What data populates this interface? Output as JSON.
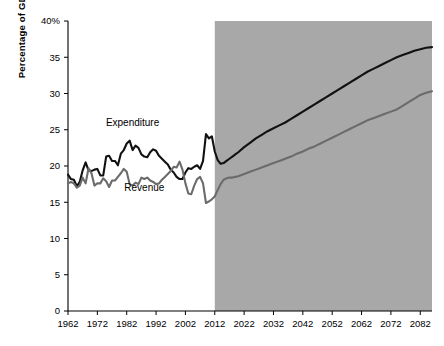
{
  "chart_data": {
    "type": "line",
    "title": "",
    "xlabel": "",
    "ylabel": "Percentage of GDP",
    "xlim": [
      1962,
      2086
    ],
    "ylim": [
      0,
      40
    ],
    "xticks": [
      1962,
      1972,
      1982,
      1992,
      2002,
      2012,
      2022,
      2032,
      2042,
      2052,
      2062,
      2072,
      2082
    ],
    "yticks": [
      0,
      5,
      10,
      15,
      20,
      25,
      30,
      35,
      40
    ],
    "ytick_labels": [
      "0",
      "5",
      "10",
      "15",
      "20",
      "25",
      "30",
      "35",
      "40%"
    ],
    "grid": false,
    "legend": "inline-annotations",
    "annotations": [
      {
        "text": "Expenditure",
        "x": 1984,
        "y": 25.5
      },
      {
        "text": "Revenue",
        "x": 1988,
        "y": 16.6
      }
    ],
    "shaded_region": {
      "label": "projection",
      "x_start": 2012,
      "x_end": 2086,
      "color": "#a8a8a8"
    },
    "series": [
      {
        "name": "Expenditure",
        "color": "#111111",
        "x": [
          1962,
          1963,
          1964,
          1965,
          1966,
          1967,
          1968,
          1969,
          1970,
          1971,
          1972,
          1973,
          1974,
          1975,
          1976,
          1977,
          1978,
          1979,
          1980,
          1981,
          1982,
          1983,
          1984,
          1985,
          1986,
          1987,
          1988,
          1989,
          1990,
          1991,
          1992,
          1993,
          1994,
          1995,
          1996,
          1997,
          1998,
          1999,
          2000,
          2001,
          2002,
          2003,
          2004,
          2005,
          2006,
          2007,
          2008,
          2009,
          2010,
          2011,
          2012,
          2013,
          2014,
          2015,
          2016,
          2017,
          2018,
          2019,
          2020,
          2022,
          2024,
          2026,
          2028,
          2030,
          2032,
          2034,
          2036,
          2038,
          2040,
          2042,
          2044,
          2046,
          2048,
          2050,
          2052,
          2054,
          2056,
          2058,
          2060,
          2062,
          2064,
          2066,
          2068,
          2070,
          2072,
          2074,
          2076,
          2078,
          2080,
          2082,
          2084,
          2086
        ],
        "y": [
          18.8,
          18.2,
          18.1,
          17.2,
          17.8,
          19.4,
          20.5,
          19.4,
          19.3,
          19.5,
          19.6,
          18.7,
          18.7,
          21.3,
          21.4,
          20.7,
          20.7,
          20.1,
          21.7,
          22.2,
          23.1,
          23.5,
          22.2,
          22.8,
          22.5,
          21.6,
          21.3,
          21.2,
          21.9,
          22.3,
          22.1,
          21.4,
          21.0,
          20.6,
          20.2,
          19.5,
          19.1,
          18.5,
          18.2,
          18.2,
          19.1,
          19.7,
          19.6,
          19.9,
          20.1,
          19.6,
          20.7,
          24.4,
          23.8,
          24.1,
          22.0,
          20.8,
          20.3,
          20.4,
          20.7,
          21.0,
          21.3,
          21.6,
          21.9,
          22.6,
          23.2,
          23.8,
          24.3,
          24.8,
          25.2,
          25.6,
          26.0,
          26.5,
          27.0,
          27.5,
          28.0,
          28.5,
          29.0,
          29.5,
          30.0,
          30.5,
          31.0,
          31.5,
          32.0,
          32.5,
          33.0,
          33.4,
          33.8,
          34.2,
          34.6,
          35.0,
          35.3,
          35.6,
          35.9,
          36.1,
          36.3,
          36.4
        ]
      },
      {
        "name": "Revenue",
        "color": "#6b6b6b",
        "x": [
          1962,
          1963,
          1964,
          1965,
          1966,
          1967,
          1968,
          1969,
          1970,
          1971,
          1972,
          1973,
          1974,
          1975,
          1976,
          1977,
          1978,
          1979,
          1980,
          1981,
          1982,
          1983,
          1984,
          1985,
          1986,
          1987,
          1988,
          1989,
          1990,
          1991,
          1992,
          1993,
          1994,
          1995,
          1996,
          1997,
          1998,
          1999,
          2000,
          2001,
          2002,
          2003,
          2004,
          2005,
          2006,
          2007,
          2008,
          2009,
          2010,
          2011,
          2012,
          2013,
          2014,
          2015,
          2016,
          2017,
          2018,
          2019,
          2020,
          2022,
          2024,
          2026,
          2028,
          2030,
          2032,
          2034,
          2036,
          2038,
          2040,
          2042,
          2044,
          2046,
          2048,
          2050,
          2052,
          2054,
          2056,
          2058,
          2060,
          2062,
          2064,
          2066,
          2068,
          2070,
          2072,
          2074,
          2076,
          2078,
          2080,
          2082,
          2084,
          2086
        ],
        "y": [
          17.6,
          17.8,
          17.6,
          17.0,
          17.3,
          18.4,
          17.6,
          19.7,
          19.0,
          17.3,
          17.6,
          17.6,
          18.3,
          17.9,
          17.1,
          18.0,
          18.0,
          18.5,
          19.0,
          19.6,
          19.2,
          17.5,
          17.3,
          17.7,
          17.5,
          18.4,
          18.2,
          18.4,
          18.0,
          17.8,
          17.5,
          17.6,
          18.1,
          18.5,
          18.9,
          19.3,
          19.9,
          19.8,
          20.6,
          19.5,
          17.6,
          16.2,
          16.1,
          17.3,
          18.2,
          18.5,
          17.6,
          14.9,
          15.1,
          15.4,
          15.8,
          16.7,
          17.5,
          18.1,
          18.3,
          18.4,
          18.4,
          18.5,
          18.6,
          18.9,
          19.2,
          19.5,
          19.8,
          20.1,
          20.4,
          20.7,
          21.0,
          21.3,
          21.7,
          22.0,
          22.4,
          22.7,
          23.1,
          23.5,
          23.9,
          24.3,
          24.7,
          25.1,
          25.5,
          25.9,
          26.3,
          26.6,
          26.9,
          27.2,
          27.5,
          27.8,
          28.3,
          28.8,
          29.3,
          29.8,
          30.1,
          30.3
        ]
      }
    ]
  },
  "axes": {
    "y_axis_title": "Percentage of GDP"
  }
}
